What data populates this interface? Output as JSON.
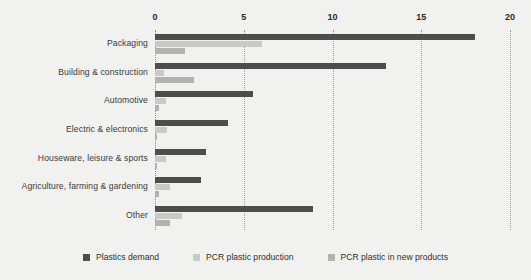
{
  "chart_data": {
    "type": "bar",
    "orientation": "horizontal",
    "title": "",
    "xlabel": "",
    "ylabel": "",
    "xlim": [
      0,
      20
    ],
    "xticks": [
      0,
      5,
      10,
      15,
      20
    ],
    "xtick_labels": [
      "0",
      "5",
      "10",
      "15",
      "20"
    ],
    "axis_position": "top",
    "grid": true,
    "grid_style": "dotted-vertical",
    "legend_position": "bottom-center",
    "categories": [
      "Packaging",
      "Building & construction",
      "Automotive",
      "Electric & electronics",
      "Houseware, leisure & sports",
      "Agriculture, farming & gardening",
      "Other"
    ],
    "series": [
      {
        "name": "Plastics demand",
        "color": "#4d4d4d",
        "values": [
          18.0,
          13.0,
          5.5,
          4.1,
          2.9,
          2.6,
          8.9
        ]
      },
      {
        "name": "PCR plastic production",
        "color": "#c9c9c7",
        "values": [
          6.0,
          0.5,
          0.6,
          0.7,
          0.6,
          0.85,
          1.5
        ]
      },
      {
        "name": "PCR plastic in new products",
        "color": "#b2b2b0",
        "values": [
          1.7,
          2.2,
          0.2,
          0.1,
          0.1,
          0.2,
          0.85
        ]
      }
    ]
  },
  "colors": {
    "background": "#f1f1ef",
    "series_1": "#4d4d4d",
    "series_2": "#c9c9c7",
    "series_3": "#b2b2b0",
    "gridline": "#9a9a98",
    "text": "#2f2f2f"
  }
}
